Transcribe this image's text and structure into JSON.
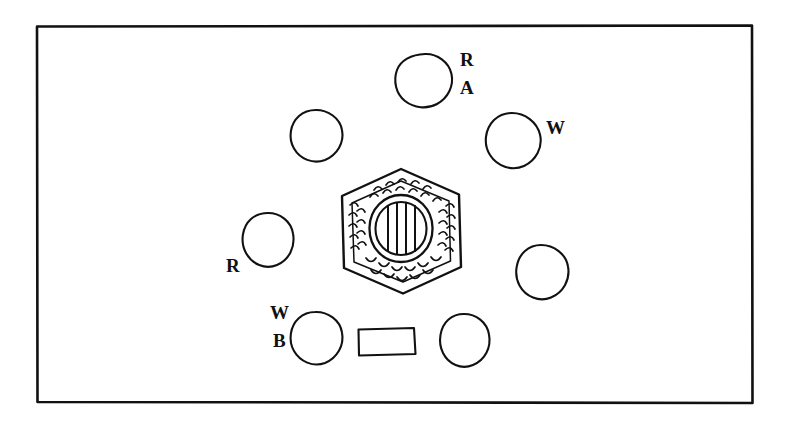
{
  "figure": {
    "kind": "hand-drawn archaeological site plan",
    "background_color": "#ffffff",
    "ink_color": "#111111",
    "frame": {
      "name": "border-frame",
      "x": 36,
      "y": 25,
      "width": 717,
      "height": 378,
      "stroke_width": 2.6
    }
  },
  "labels": [
    {
      "id": "label-ra-r",
      "text": "R",
      "x": 460,
      "y": 60
    },
    {
      "id": "label-ra-a",
      "text": "A",
      "x": 460,
      "y": 88
    },
    {
      "id": "label-w-right",
      "text": "W",
      "x": 546,
      "y": 128
    },
    {
      "id": "label-r-left",
      "text": "R",
      "x": 226,
      "y": 266
    },
    {
      "id": "label-wb-w",
      "text": "W",
      "x": 272,
      "y": 313
    },
    {
      "id": "label-wb-b",
      "text": "B",
      "x": 274,
      "y": 341
    }
  ],
  "features": {
    "stones": [
      {
        "id": "stone-top",
        "name": "stone-circle-top",
        "cx": 425,
        "cy": 80,
        "rx": 27,
        "ry": 26,
        "label": "R / A"
      },
      {
        "id": "stone-upper-left",
        "name": "stone-circle-upper-left",
        "cx": 316,
        "cy": 136,
        "rx": 26,
        "ry": 26,
        "label": ""
      },
      {
        "id": "stone-upper-right",
        "name": "stone-circle-upper-right",
        "cx": 512,
        "cy": 141,
        "rx": 28,
        "ry": 28,
        "label": "W"
      },
      {
        "id": "stone-left",
        "name": "stone-circle-left",
        "cx": 268,
        "cy": 240,
        "rx": 25,
        "ry": 27,
        "label": "R"
      },
      {
        "id": "stone-right",
        "name": "stone-circle-right",
        "cx": 541,
        "cy": 272,
        "rx": 27,
        "ry": 27,
        "label": ""
      },
      {
        "id": "stone-lower-left",
        "name": "stone-circle-lower-left",
        "cx": 315,
        "cy": 338,
        "rx": 26,
        "ry": 26,
        "label": "W / B"
      },
      {
        "id": "stone-lower-right",
        "name": "stone-circle-lower-right",
        "cx": 464,
        "cy": 340,
        "rx": 25,
        "ry": 26,
        "label": ""
      }
    ],
    "rectangle": {
      "id": "slab-rectangle",
      "name": "rectangular-slab",
      "x": 358,
      "y": 328,
      "width": 57,
      "height": 27,
      "label": ""
    },
    "central_hexagon": {
      "id": "central-hexagon",
      "name": "central-hexagonal-feature",
      "cx": 401,
      "cy": 231,
      "radius": 62,
      "hatching": "scalloped tick marks around inner border",
      "inner_ring": {
        "name": "inner-ring",
        "cx": 401,
        "cy": 228,
        "rx": 31,
        "ry": 33
      },
      "inner_disc": {
        "name": "striped-disc",
        "cx": 401,
        "cy": 228,
        "rx": 25,
        "ry": 27,
        "stripes": 3
      }
    }
  }
}
